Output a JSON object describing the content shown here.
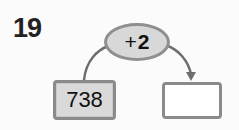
{
  "problem": {
    "number": "19",
    "operation": {
      "operator": "+",
      "operand": "2",
      "label": "+2"
    },
    "input_value": "738",
    "output_value": ""
  },
  "colors": {
    "oval_fill": "#d8d8d8",
    "border": "#8a8a8a",
    "input_box_fill": "#d9d9d9",
    "output_box_fill": "#ffffff",
    "arrow": "#6e6e6e"
  }
}
